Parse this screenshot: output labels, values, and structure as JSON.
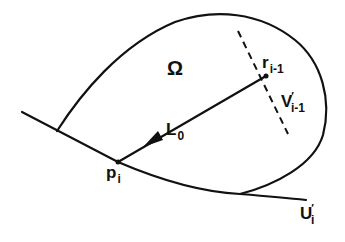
{
  "figure": {
    "stroke_color": "#111111",
    "background": "#ffffff",
    "labels": {
      "region": {
        "main": "Ω"
      },
      "r": {
        "main": "r",
        "sub": "i-1"
      },
      "v": {
        "main": "V",
        "sup": "′",
        "sub": "i-1"
      },
      "l": {
        "main": "L",
        "sub": "0"
      },
      "p": {
        "main": "p",
        "sub": "i"
      },
      "u": {
        "main": "U",
        "sup": "′",
        "sub": "i"
      }
    },
    "elements": [
      "region Ω bounded by closed curve",
      "boundary curve U′ᵢ",
      "point pᵢ on boundary",
      "point rᵢ₋₁ inside region",
      "path L₀ from rᵢ₋₁ to pᵢ with arrow",
      "dashed line V′ᵢ₋₁ through rᵢ₋₁"
    ]
  }
}
